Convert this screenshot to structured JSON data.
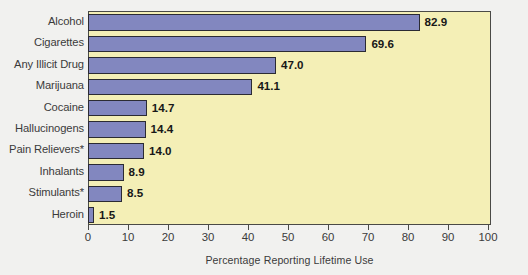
{
  "chart_data": {
    "type": "bar",
    "orientation": "horizontal",
    "title": "",
    "xlabel": "Percentage Reporting Lifetime Use",
    "ylabel": "",
    "xlim": [
      0,
      100
    ],
    "xticks": [
      0,
      10,
      20,
      30,
      40,
      50,
      60,
      70,
      80,
      90,
      100
    ],
    "xtick_labels": [
      "0",
      "10",
      "20",
      "30",
      "40",
      "50",
      "60",
      "70",
      "80",
      "90",
      "100"
    ],
    "grid": false,
    "legend": null,
    "categories": [
      "Alcohol",
      "Cigarettes",
      "Any Illicit Drug",
      "Marijuana",
      "Cocaine",
      "Hallucinogens",
      "Pain Relievers*",
      "Inhalants",
      "Stimulants*",
      "Heroin"
    ],
    "values": [
      82.9,
      69.6,
      47.0,
      41.1,
      14.7,
      14.4,
      14.0,
      8.9,
      8.5,
      1.5
    ],
    "value_labels": [
      "82.9",
      "69.6",
      "47.0",
      "41.1",
      "14.7",
      "14.4",
      "14.0",
      "8.9",
      "8.5",
      "1.5"
    ],
    "colors": {
      "bar_fill": "#8287BF",
      "bar_edge": "#2B2B33",
      "plot_background": "#F4EFB6",
      "plot_border": "#4A4A46",
      "page_background": "#F1F1EF",
      "text": "#3B3B3B",
      "value_text": "#181818"
    }
  }
}
